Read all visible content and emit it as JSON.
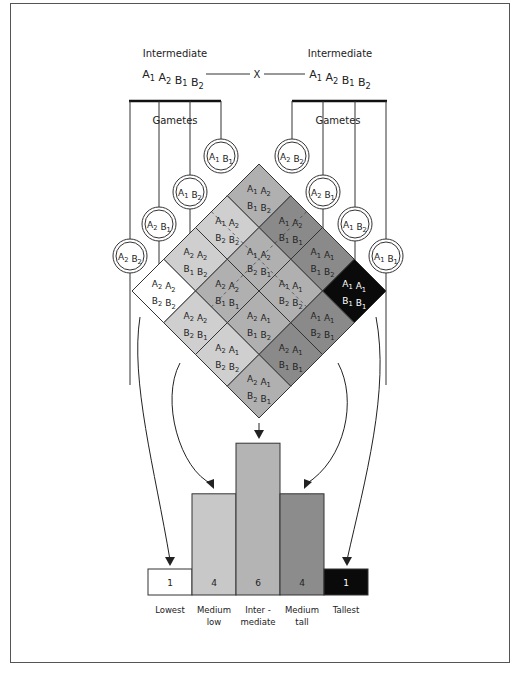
{
  "parents": {
    "left": {
      "phenotype": "Intermediate",
      "genotype": [
        "A",
        "1",
        "A",
        "2",
        "B",
        "1",
        "B",
        "2"
      ]
    },
    "right": {
      "phenotype": "Intermediate",
      "genotype": [
        "A",
        "1",
        "A",
        "2",
        "B",
        "1",
        "B",
        "2"
      ]
    },
    "cross_symbol": "X"
  },
  "gametes": {
    "label": "Gametes",
    "left": [
      {
        "a": "A",
        "ai": "1",
        "b": "B",
        "bi": "1"
      },
      {
        "a": "A",
        "ai": "1",
        "b": "B",
        "bi": "2"
      },
      {
        "a": "A",
        "ai": "2",
        "b": "B",
        "bi": "1"
      },
      {
        "a": "A",
        "ai": "2",
        "b": "B",
        "bi": "2"
      }
    ],
    "right": [
      {
        "a": "A",
        "ai": "2",
        "b": "B",
        "bi": "2"
      },
      {
        "a": "A",
        "ai": "2",
        "b": "B",
        "bi": "1"
      },
      {
        "a": "A",
        "ai": "1",
        "b": "B",
        "bi": "2"
      },
      {
        "a": "A",
        "ai": "1",
        "b": "B",
        "bi": "1"
      }
    ]
  },
  "cells": [
    {
      "i": 0,
      "j": 0,
      "top": "A1 A2",
      "bottom": "B1 B2",
      "shade": "#b0b0b0",
      "text": "#222"
    },
    {
      "i": 0,
      "j": 1,
      "top": "A1 A2",
      "bottom": "B1 B1",
      "shade": "#8a8a8a",
      "text": "#222"
    },
    {
      "i": 0,
      "j": 2,
      "top": "A1 A1",
      "bottom": "B1 B2",
      "shade": "#8a8a8a",
      "text": "#222"
    },
    {
      "i": 0,
      "j": 3,
      "top": "A1 A1",
      "bottom": "B1 B1",
      "shade": "#0a0a0a",
      "text": "#fff"
    },
    {
      "i": 1,
      "j": 0,
      "top": "A1 A2",
      "bottom": "B2 B2",
      "shade": "#cfcfcf",
      "text": "#222"
    },
    {
      "i": 1,
      "j": 1,
      "top": "A1 A2",
      "bottom": "B2 B1",
      "shade": "#b0b0b0",
      "text": "#222"
    },
    {
      "i": 1,
      "j": 2,
      "top": "A1 A1",
      "bottom": "B2 B2",
      "shade": "#b0b0b0",
      "text": "#222"
    },
    {
      "i": 1,
      "j": 3,
      "top": "A1 A1",
      "bottom": "B2 B1",
      "shade": "#8a8a8a",
      "text": "#222"
    },
    {
      "i": 2,
      "j": 0,
      "top": "A2 A2",
      "bottom": "B1 B2",
      "shade": "#cfcfcf",
      "text": "#222"
    },
    {
      "i": 2,
      "j": 1,
      "top": "A2 A2",
      "bottom": "B1 B1",
      "shade": "#b0b0b0",
      "text": "#222"
    },
    {
      "i": 2,
      "j": 2,
      "top": "A2 A1",
      "bottom": "B1 B2",
      "shade": "#b0b0b0",
      "text": "#222"
    },
    {
      "i": 2,
      "j": 3,
      "top": "A2 A1",
      "bottom": "B1 B1",
      "shade": "#8a8a8a",
      "text": "#222"
    },
    {
      "i": 3,
      "j": 0,
      "top": "A2 A2",
      "bottom": "B2 B2",
      "shade": "#ffffff",
      "text": "#222"
    },
    {
      "i": 3,
      "j": 1,
      "top": "A2 A2",
      "bottom": "B2 B1",
      "shade": "#cfcfcf",
      "text": "#222"
    },
    {
      "i": 3,
      "j": 2,
      "top": "A2 A1",
      "bottom": "B2 B2",
      "shade": "#cfcfcf",
      "text": "#222"
    },
    {
      "i": 3,
      "j": 3,
      "top": "A2 A1",
      "bottom": "B2 B1",
      "shade": "#b0b0b0",
      "text": "#222"
    }
  ],
  "chart_data": {
    "type": "bar",
    "title": "",
    "categories": [
      "Lowest",
      "Medium low",
      "Inter - mediate",
      "Medium tall",
      "Tallest"
    ],
    "values": [
      1,
      4,
      6,
      4,
      1
    ],
    "xlabel": "",
    "ylabel": "",
    "ylim": [
      0,
      6
    ],
    "grid": false,
    "bar_colors": [
      "#ffffff",
      "#c8c8c8",
      "#b4b4b4",
      "#8c8c8c",
      "#0a0a0a"
    ],
    "value_label_colors": [
      "#222222",
      "#222222",
      "#222222",
      "#222222",
      "#ffffff"
    ]
  },
  "bars": [
    {
      "value": "1",
      "label1": "Lowest",
      "label2": ""
    },
    {
      "value": "4",
      "label1": "Medium",
      "label2": "low"
    },
    {
      "value": "6",
      "label1": "Inter -",
      "label2": "mediate"
    },
    {
      "value": "4",
      "label1": "Medium",
      "label2": "tall"
    },
    {
      "value": "1",
      "label1": "Tallest",
      "label2": ""
    }
  ]
}
